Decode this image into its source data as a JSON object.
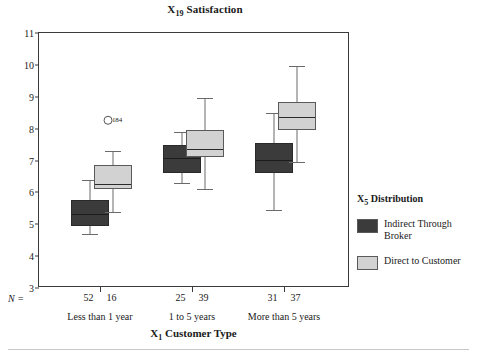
{
  "chart_data": {
    "type": "box",
    "title": "X19 Satisfaction",
    "title_main": "Satisfaction",
    "title_var": "X",
    "title_sub": "19",
    "xlabel": "X1 Customer Type",
    "xlabel_main": "Customer Type",
    "xlabel_var": "X",
    "xlabel_sub": "1",
    "ylabel": "",
    "ylim": [
      3,
      11
    ],
    "yticks": [
      11,
      10,
      9,
      8,
      7,
      6,
      5,
      4,
      3
    ],
    "grid": false,
    "categories": [
      "Less than 1 year",
      "1 to 5 years",
      "More than 5 years"
    ],
    "n_label": "N =",
    "legend": {
      "title": "X5 Distribution",
      "title_var": "X",
      "title_sub": "5",
      "title_main": "Distribution",
      "position": "right",
      "entries": [
        {
          "name": "Indirect Through Broker",
          "color": "#3b3b3b"
        },
        {
          "name": "Direct to Customer",
          "color": "#d2d2d2"
        }
      ]
    },
    "series": [
      {
        "name": "Indirect Through Broker",
        "color": "#3b3b3b",
        "boxes": [
          {
            "category": "Less than 1 year",
            "n": 52,
            "whisker_low": 4.7,
            "q1": 4.95,
            "median": 5.35,
            "q3": 5.75,
            "whisker_high": 6.4
          },
          {
            "category": "1 to 5 years",
            "n": 25,
            "whisker_low": 6.3,
            "q1": 6.6,
            "median": 7.1,
            "q3": 7.5,
            "whisker_high": 7.9
          },
          {
            "category": "More than 5 years",
            "n": 31,
            "whisker_low": 5.45,
            "q1": 6.6,
            "median": 7.05,
            "q3": 7.55,
            "whisker_high": 8.5
          }
        ]
      },
      {
        "name": "Direct to Customer",
        "color": "#d2d2d2",
        "boxes": [
          {
            "category": "Less than 1 year",
            "n": 16,
            "whisker_low": 5.4,
            "q1": 6.1,
            "median": 6.3,
            "q3": 6.85,
            "whisker_high": 7.3
          },
          {
            "category": "1 to 5 years",
            "n": 39,
            "whisker_low": 6.1,
            "q1": 7.1,
            "median": 7.4,
            "q3": 7.95,
            "whisker_high": 8.95
          },
          {
            "category": "More than 5 years",
            "n": 37,
            "whisker_low": 6.95,
            "q1": 7.95,
            "median": 8.4,
            "q3": 8.85,
            "whisker_high": 9.95
          }
        ]
      }
    ],
    "outliers": [
      {
        "label": "184",
        "value": 8.3,
        "category": "Less than 1 year",
        "series": "Direct to Customer",
        "marker": "open-circle"
      }
    ]
  }
}
